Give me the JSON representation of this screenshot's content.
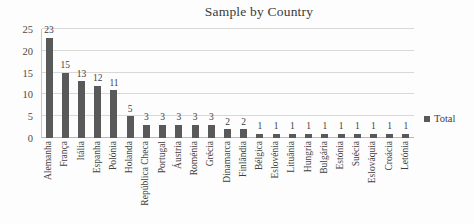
{
  "chart_data": {
    "type": "bar",
    "title": "Sample by Country",
    "xlabel": "",
    "ylabel": "",
    "ylim": [
      0,
      25
    ],
    "yticks": [
      0,
      5,
      10,
      15,
      20,
      25
    ],
    "grid": true,
    "legend_position": "right",
    "series_name": "Total",
    "bar_color": "#595959",
    "categories": [
      "Alemanha",
      "França",
      "Itália",
      "Espanha",
      "Polónia",
      "Holanda",
      "República Checa",
      "Portugal",
      "Áustria",
      "Roménia",
      "Grécia",
      "Dinamarca",
      "Finlândia",
      "Bélgica",
      "Eslovénia",
      "Lituânia",
      "Hungria",
      "Bulgária",
      "Estónia",
      "Suécia",
      "Eslováquia",
      "Croácia",
      "Letónia"
    ],
    "values": [
      23,
      15,
      13,
      12,
      11,
      5,
      3,
      3,
      3,
      3,
      3,
      2,
      2,
      1,
      1,
      1,
      1,
      1,
      1,
      1,
      1,
      1,
      1
    ],
    "series": [
      {
        "name": "Total",
        "values": [
          23,
          15,
          13,
          12,
          11,
          5,
          3,
          3,
          3,
          3,
          3,
          2,
          2,
          1,
          1,
          1,
          1,
          1,
          1,
          1,
          1,
          1,
          1
        ]
      }
    ]
  },
  "legend": {
    "entries": [
      {
        "label": "Total",
        "color": "#595959"
      }
    ]
  }
}
